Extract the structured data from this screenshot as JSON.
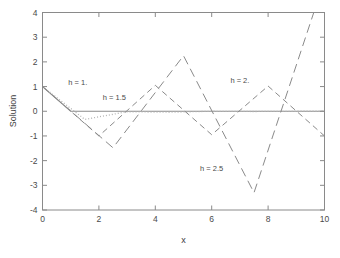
{
  "chart_data": {
    "type": "line",
    "title": "",
    "xlabel": "x",
    "ylabel": "Solution",
    "xlim": [
      0,
      10
    ],
    "ylim": [
      -4,
      4
    ],
    "xticks": [
      "0",
      "2",
      "4",
      "6",
      "8",
      "10"
    ],
    "xtick_values": [
      0,
      2,
      4,
      6,
      8,
      10
    ],
    "ytick_values": [
      -4,
      -3,
      -2,
      -1,
      0,
      1,
      2,
      3,
      4
    ],
    "yticks": [
      "-4",
      "-3",
      "-2",
      "-1",
      "0",
      "1",
      "2",
      "3",
      "4"
    ],
    "grid": false,
    "legend": "inline-annotations",
    "series": [
      {
        "name": "h = 1.",
        "style": "solid",
        "color": "#8a8a8a",
        "label_x": 1.25,
        "label_y": 1.08,
        "points": [
          [
            0,
            1
          ],
          [
            1,
            0
          ],
          [
            2,
            0
          ],
          [
            3,
            0
          ],
          [
            4,
            0
          ],
          [
            5,
            0
          ],
          [
            6,
            0
          ],
          [
            7,
            0
          ],
          [
            8,
            0
          ],
          [
            9,
            0
          ],
          [
            10,
            0
          ]
        ]
      },
      {
        "name": "h = 1.5",
        "style": "dotted",
        "color": "#b4b4b4",
        "label_x": 2.55,
        "label_y": 0.44,
        "points": [
          [
            0,
            1
          ],
          [
            1.5,
            -0.33
          ],
          [
            3,
            -0.02
          ],
          [
            4.5,
            -0.04
          ],
          [
            6,
            0
          ],
          [
            7.5,
            -0.01
          ],
          [
            9,
            0
          ],
          [
            10,
            0
          ]
        ]
      },
      {
        "name": "h = 2.",
        "style": "dashed",
        "color": "#8a8a8a",
        "label_x": 7.0,
        "label_y": 1.15,
        "points": [
          [
            0,
            1
          ],
          [
            2,
            -1
          ],
          [
            4,
            1.05
          ],
          [
            6,
            -0.95
          ],
          [
            8,
            1.02
          ],
          [
            10,
            -1
          ]
        ]
      },
      {
        "name": "h = 2.5",
        "style": "longdash",
        "color": "#8a8a8a",
        "label_x": 6.0,
        "label_y": -2.4,
        "points": [
          [
            0,
            1
          ],
          [
            2.5,
            -1.48
          ],
          [
            5,
            2.25
          ],
          [
            7.5,
            -3.3
          ],
          [
            9.62,
            4
          ]
        ]
      }
    ]
  },
  "figure": {
    "background": "#ffffff",
    "axis_color": "#8a8a8a"
  }
}
